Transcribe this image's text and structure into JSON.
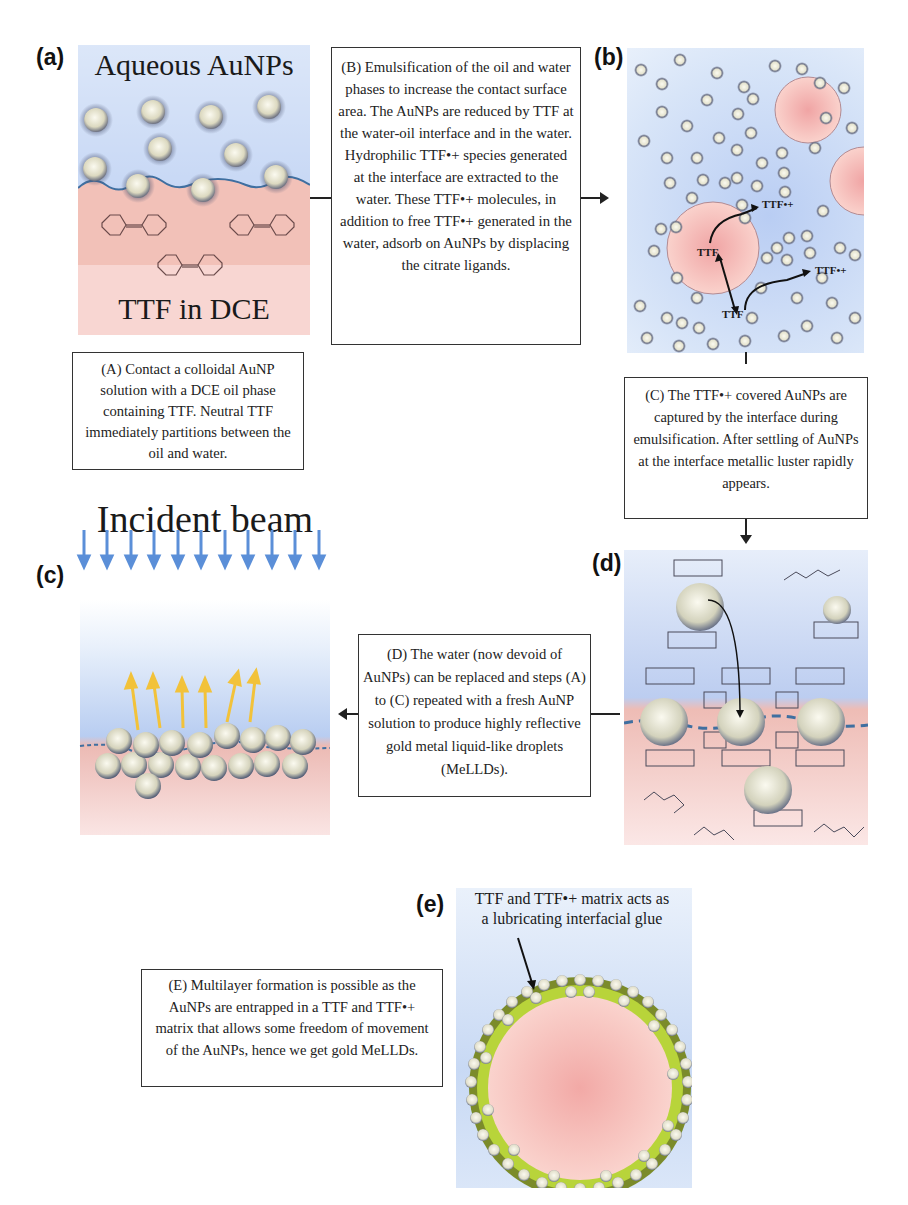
{
  "figure": {
    "panels": {
      "a": {
        "label": "(a)",
        "top_text": "Aqueous AuNPs",
        "bottom_text": "TTF in DCE"
      },
      "b": {
        "label": "(b)",
        "annotations": [
          "TTF•+",
          "TTF",
          "TTF•+",
          "TTF"
        ]
      },
      "c": {
        "label": "(c)",
        "title": "Incident beam"
      },
      "d": {
        "label": "(d)"
      },
      "e": {
        "label": "(e)",
        "caption_line1": "TTF and TTF•+ matrix acts as",
        "caption_line2": "a lubricating interfacial glue"
      }
    },
    "steps": {
      "A": "(A) Contact a colloidal AuNP solution with a DCE oil phase containing TTF. Neutral TTF immediately partitions between the oil and water.",
      "B": "(B) Emulsification of the oil and water phases to increase the contact surface area. The AuNPs are reduced by TTF at the water-oil interface and in the water. Hydrophilic TTF•+ species generated at the interface are extracted to the water. These TTF•+ molecules, in addition to free TTF•+ generated in the water, adsorb on AuNPs by displacing the citrate ligands.",
      "C": "(C) The TTF•+ covered AuNPs are captured by the interface during emulsification. After settling of AuNPs at the interface metallic luster rapidly appears.",
      "D": "(D) The water (now devoid of AuNPs) can be replaced and steps (A) to (C) repeated with a fresh AuNP solution to produce highly reflective gold metal liquid-like droplets (MeLLDs).",
      "E": "(E) Multilayer formation is possible as the AuNPs are entrapped in a TTF and TTF•+ matrix that allows some freedom of movement of the AuNPs, hence we get gold MeLLDs."
    },
    "colors": {
      "water": "#c9daf5",
      "oil": "#f0b8b0",
      "interface": "#3f6fa0",
      "nanoparticle": "#e8e6d0",
      "beam": "#5b8fd8",
      "reflected": "#f2c23a",
      "glue": "#b8d43a"
    }
  }
}
